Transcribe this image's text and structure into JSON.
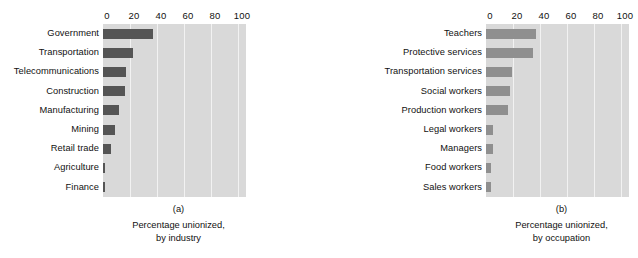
{
  "figure": {
    "background": "#ffffff",
    "plot_background": "#d9d9d9",
    "gridline_color": "#f2f2f2"
  },
  "chart_data": [
    {
      "type": "bar",
      "orientation": "horizontal",
      "panel": "(a)",
      "title": "",
      "caption_line1": "Percentage unionized,",
      "caption_line2": "by industry",
      "xlabel": "",
      "ylabel": "",
      "xlim": [
        0,
        100
      ],
      "ticks": [
        0,
        20,
        40,
        60,
        80,
        100
      ],
      "tick_labels": [
        "0",
        "20",
        "40",
        "60",
        "80",
        "100"
      ],
      "grid": true,
      "legend": "none",
      "bar_color": "#555555",
      "categories": [
        "Government",
        "Transportation",
        "Telecommunications",
        "Construction",
        "Manufacturing",
        "Mining",
        "Retail trade",
        "Agriculture",
        "Finance"
      ],
      "values": [
        37,
        22,
        17,
        16,
        12,
        9,
        6,
        1.5,
        1.5
      ]
    },
    {
      "type": "bar",
      "orientation": "horizontal",
      "panel": "(b)",
      "title": "",
      "caption_line1": "Percentage unionized,",
      "caption_line2": "by occupation",
      "xlabel": "",
      "ylabel": "",
      "xlim": [
        0,
        100
      ],
      "ticks": [
        0,
        20,
        40,
        60,
        80,
        100
      ],
      "tick_labels": [
        "0",
        "20",
        "40",
        "60",
        "80",
        "100"
      ],
      "grid": true,
      "legend": "none",
      "bar_color": "#8f8f8f",
      "categories": [
        "Teachers",
        "Protective services",
        "Transportation services",
        "Social workers",
        "Production workers",
        "Legal workers",
        "Managers",
        "Food workers",
        "Sales workers"
      ],
      "values": [
        37,
        35,
        19,
        18,
        16,
        5,
        5,
        4,
        3.5
      ]
    }
  ]
}
